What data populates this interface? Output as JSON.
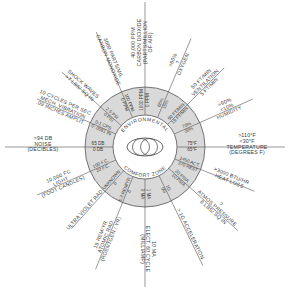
{
  "diagram": {
    "title_top": "ENVIRONMENTAL",
    "title_bottom": "COMFORT ZONE",
    "colors": {
      "ring": "#d9d9d9",
      "line": "#555555",
      "text": "#3a3a3a",
      "background": "#ffffff"
    },
    "center": [
      145,
      147
    ],
    "inner_radius": 32,
    "outer_radius": 60,
    "spokes": [
      {
        "id": "oxygen",
        "angle": -67,
        "length": 118,
        "label": [
          "OXYGEN"
        ],
        "limit": [
          ">60%",
          "?"
        ],
        "ring": [
          "60%",
          "15%"
        ]
      },
      {
        "id": "ventilation",
        "angle": -45,
        "length": 112,
        "label": [
          "50 FT/MIN",
          "VENTILATION",
          "5 FT/MIN"
        ],
        "limit": [],
        "ring": [
          "50 FT/MIN",
          "15 FT/MIN"
        ]
      },
      {
        "id": "humidity",
        "angle": -24,
        "length": 118,
        "label": [
          "HUMIDITY"
        ],
        "limit": [
          ">90%",
          "<10%"
        ],
        "ring": [
          "70%",
          "30%"
        ]
      },
      {
        "id": "temperature",
        "angle": 0,
        "length": 140,
        "label": [
          "TEMPERATURE",
          "(DEGREES F)"
        ],
        "limit": [
          ">110°F",
          "<30°F"
        ],
        "ring": [
          "75°F",
          "65°F"
        ]
      },
      {
        "id": "heat-loss",
        "angle": 22,
        "length": 118,
        "label": [
          ">3000 BTU/HR",
          "HEAT LOSS"
        ],
        "limit": [],
        "ring": [
          "1450 ACT.",
          "370 REST"
        ]
      },
      {
        "id": "atmos-pressure",
        "angle": 42,
        "length": 125,
        "label": [
          "?",
          "ATMOS PRESSURE",
          "8 LBS/ SQ IN"
        ],
        "limit": [],
        "ring": [
          "20 PSIA",
          "10 PSIA"
        ]
      },
      {
        "id": "acceleration",
        "angle": 64,
        "length": 132,
        "label": [
          "> 1G ACCELERATION"
        ],
        "limit": [],
        "ring": [
          "1G",
          "0G"
        ]
      },
      {
        "id": "electric",
        "angle": 90,
        "length": 140,
        "label": [
          "10 MA",
          "ELECT. 60 CYCLE",
          "(MILLIAMP)"
        ],
        "limit": [],
        "ring": [
          "1 MA",
          "0 MA"
        ]
      },
      {
        "id": "atomic-rad",
        "angle": 112,
        "length": 132,
        "label": [
          "15 REM/YR",
          "ATOMIC RAD",
          "(ROENTGEN / YR)"
        ],
        "limit": [],
        "ring": [
          "0.3 REM/YR",
          "0"
        ]
      },
      {
        "id": "ultra-violet",
        "angle": 132,
        "length": 110,
        "label": [
          "ULTRA VIOLET RAD"
        ],
        "limit": [],
        "ring": [
          "UNKNOWN",
          "0"
        ]
      },
      {
        "id": "light",
        "angle": 156,
        "length": 118,
        "label": [
          "10,000 FC",
          "LIGHT",
          "(FOOT CANDLES)"
        ],
        "limit": [],
        "ring": [
          "100 F.C.",
          "20 F.C."
        ]
      },
      {
        "id": "noise",
        "angle": 180,
        "length": 140,
        "label": [
          "NOISE",
          "(DECIBLES)"
        ],
        "limit": [
          ">94 DB"
        ],
        "ring": [
          "65 DB",
          "0 DB"
        ]
      },
      {
        "id": "mech-vibration",
        "angle": -156,
        "length": 118,
        "label": [
          "10 CYCLES PER SEC",
          "MECH. VIBRATION",
          ".09 INCHES AMPLIT."
        ],
        "limit": [],
        "ring": [
          "0-1 CPS",
          "0-.0081 IN"
        ]
      },
      {
        "id": "shock-waves",
        "angle": -138,
        "length": 112,
        "label": [
          "SHOCK WAVES",
          ">7 LBS/ SQ IN"
        ],
        "limit": [],
        "ring": [
          "2.5 PSI",
          "0 PSI"
        ]
      },
      {
        "id": "carbon-monoxide",
        "angle": -113,
        "length": 125,
        "label": [
          "3000 PARTS/MIL",
          "CARBON MONOXIDE"
        ],
        "limit": [],
        "ring": [
          "100 PPM",
          "0 PPM"
        ]
      },
      {
        "id": "carbon-dioxide",
        "angle": -90,
        "length": 145,
        "label": [
          "40,000 PPM",
          "CARBON DIOXIDE",
          "(PARTS/MILLION",
          "OF AIR)"
        ],
        "limit": [],
        "ring": [
          "1000 PPM",
          "0 PPM"
        ]
      }
    ]
  }
}
